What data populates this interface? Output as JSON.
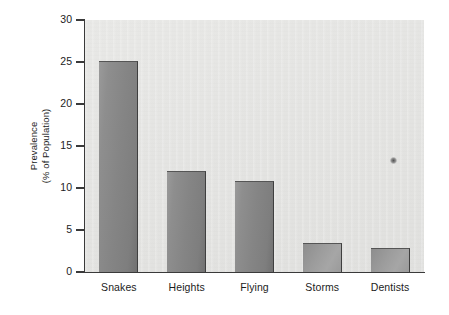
{
  "chart_data": {
    "type": "bar",
    "title": "",
    "xlabel": "",
    "ylabel_line1": "Prevalence",
    "ylabel_line2": "(% of Population)",
    "categories": [
      "Snakes",
      "Heights",
      "Flying",
      "Storms",
      "Dentists"
    ],
    "values": [
      25.1,
      12.0,
      10.8,
      3.4,
      2.9
    ],
    "ylim": [
      0,
      30
    ],
    "ytick_labels": [
      "0",
      "5",
      "10",
      "15",
      "20",
      "25",
      "30"
    ],
    "ytick_values": [
      0,
      5,
      10,
      15,
      20,
      25,
      30
    ],
    "grid": false,
    "legend": null,
    "bar_color": "#878787",
    "plot_background": "#e5e5e3",
    "axis_color": "#3a3a3a",
    "text_color": "#1c1c1c"
  }
}
